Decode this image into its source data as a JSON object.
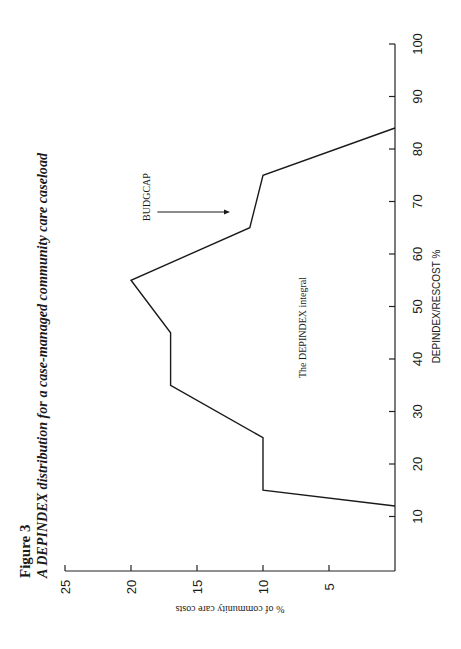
{
  "chart_data": {
    "type": "line",
    "figure_label": "Figure 3",
    "title": "A DEPINDEX distribution for a case-managed community care caseload",
    "xlabel": "DEPINDEX/RESCOST %",
    "ylabel": "% of community care costs",
    "orientation": "rotated-90-ccw",
    "xlim": [
      0,
      100
    ],
    "ylim": [
      0,
      25
    ],
    "x_ticks": [
      10,
      20,
      30,
      40,
      50,
      60,
      70,
      80,
      90,
      100
    ],
    "y_ticks": [
      5,
      10,
      15,
      20,
      25
    ],
    "grid": false,
    "series": [
      {
        "name": "DEPINDEX distribution",
        "x": [
          12,
          15,
          25,
          35,
          45,
          55,
          65,
          75,
          84
        ],
        "y": [
          0,
          10,
          10,
          17,
          17,
          20,
          11,
          10,
          0
        ]
      }
    ],
    "annotations": [
      {
        "text": "BUDGCAP",
        "type": "arrow",
        "x": 68,
        "y_from": 18,
        "y_to": 12.5
      },
      {
        "text": "The DEPINDEX integral",
        "type": "label",
        "x": 46,
        "y": 7
      }
    ]
  }
}
